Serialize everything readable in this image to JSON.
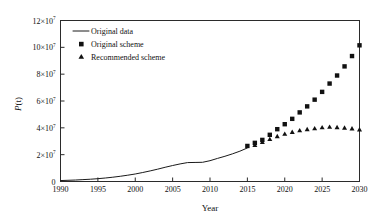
{
  "chart_data": {
    "type": "line",
    "title": "",
    "xlabel": "Year",
    "ylabel": "P(t)",
    "ylabel_italic_part": "P",
    "ylabel_rest": "(t)",
    "xlim": [
      1990,
      2030
    ],
    "ylim": [
      0,
      120000000
    ],
    "xticks": [
      1990,
      1995,
      2000,
      2005,
      2010,
      2015,
      2020,
      2025,
      2030
    ],
    "xtick_labels": [
      "1990",
      "1995",
      "2000",
      "2005",
      "2010",
      "2015",
      "2020",
      "2025",
      "2030"
    ],
    "yticks": [
      0,
      20000000,
      40000000,
      60000000,
      80000000,
      100000000,
      120000000
    ],
    "ytick_labels": [
      "0",
      "2×10",
      "4×10",
      "6×10",
      "8×10",
      "10×10",
      "12×10"
    ],
    "ytick_exponents": [
      "",
      "7",
      "7",
      "7",
      "7",
      "7",
      "7"
    ],
    "grid": false,
    "legend_position": "top-left-inside",
    "legend": [
      {
        "label": "Original data",
        "marker": "line",
        "color": "#1a1a1a"
      },
      {
        "label": "Original scheme",
        "marker": "square",
        "color": "#111111"
      },
      {
        "label": "Recommended scheme",
        "marker": "triangle",
        "color": "#111111"
      }
    ],
    "series": [
      {
        "name": "Original data",
        "marker": "line",
        "x": [
          1990,
          1991,
          1992,
          1993,
          1994,
          1995,
          1996,
          1997,
          1998,
          1999,
          2000,
          2001,
          2002,
          2003,
          2004,
          2005,
          2006,
          2007,
          2008,
          2009,
          2010,
          2011,
          2012,
          2013,
          2014,
          2015
        ],
        "values": [
          700000,
          900000,
          1100000,
          1400000,
          1700000,
          2100000,
          2600000,
          3200000,
          3900000,
          4700000,
          5600000,
          6700000,
          7900000,
          9200000,
          10600000,
          11900000,
          13100000,
          14100000,
          14200000,
          14300000,
          15500000,
          17200000,
          18800000,
          20600000,
          22600000,
          25000000
        ]
      },
      {
        "name": "Original scheme",
        "marker": "square",
        "x": [
          2015,
          2016,
          2017,
          2018,
          2019,
          2020,
          2021,
          2022,
          2023,
          2024,
          2025,
          2026,
          2027,
          2028,
          2029,
          2030
        ],
        "values": [
          26500000,
          28800000,
          31000000,
          34800000,
          39000000,
          42700000,
          46700000,
          51500000,
          56000000,
          61000000,
          66800000,
          73000000,
          79000000,
          85800000,
          93500000,
          101500000
        ]
      },
      {
        "name": "Recommended scheme",
        "marker": "triangle",
        "x": [
          2016,
          2017,
          2018,
          2019,
          2020,
          2021,
          2022,
          2023,
          2024,
          2025,
          2026,
          2027,
          2028,
          2029,
          2030
        ],
        "values": [
          27300000,
          29500000,
          31800000,
          33900000,
          35700000,
          37100000,
          38300000,
          39100000,
          39800000,
          40500000,
          40900000,
          40600000,
          40200000,
          39700000,
          39000000
        ]
      }
    ]
  },
  "axes": {
    "x_title": "Year",
    "y_title_italic": "P",
    "y_title_rest": "(t)"
  }
}
